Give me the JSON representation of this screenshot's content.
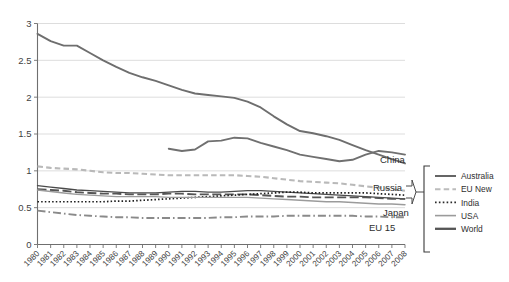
{
  "chart_data": {
    "type": "line",
    "title": "",
    "xlabel": "",
    "ylabel": "",
    "ylim": [
      0,
      3
    ],
    "yticks": [
      "0",
      "0.5",
      "1",
      "1.5",
      "2",
      "2.5",
      "3"
    ],
    "grid": true,
    "legend_position": "right",
    "x": [
      1980,
      1981,
      1982,
      1983,
      1984,
      1985,
      1986,
      1987,
      1988,
      1989,
      1990,
      1991,
      1992,
      1993,
      1994,
      1995,
      1996,
      1997,
      1998,
      1999,
      2000,
      2001,
      2002,
      2003,
      2004,
      2005,
      2006,
      2007,
      2008
    ],
    "xticklabels": [
      "1980",
      "1981",
      "1982",
      "1983",
      "1984",
      "1985",
      "1986",
      "1987",
      "1988",
      "1989",
      "1990",
      "1991",
      "1992",
      "1993",
      "1994",
      "1995",
      "1996",
      "1997",
      "1998",
      "1999",
      "2000",
      "2001",
      "2002",
      "2003",
      "2004",
      "2005",
      "2006",
      "2007",
      "2008"
    ],
    "series": [
      {
        "name": "China",
        "color": "#6e6e6e",
        "style": "solid",
        "width": 1.9,
        "values": [
          2.86,
          2.76,
          2.7,
          2.7,
          2.6,
          2.5,
          2.41,
          2.33,
          2.27,
          2.22,
          2.16,
          2.1,
          2.05,
          2.03,
          2.01,
          1.99,
          1.94,
          1.86,
          1.74,
          1.63,
          1.54,
          1.51,
          1.47,
          1.42,
          1.35,
          1.28,
          1.22,
          1.16,
          1.1
        ]
      },
      {
        "name": "Russia",
        "color": "#707070",
        "style": "solid",
        "width": 1.9,
        "values": [
          null,
          null,
          null,
          null,
          null,
          null,
          null,
          null,
          null,
          null,
          1.3,
          1.27,
          1.29,
          1.4,
          1.41,
          1.45,
          1.44,
          1.38,
          1.33,
          1.28,
          1.22,
          1.19,
          1.16,
          1.13,
          1.15,
          1.22,
          1.27,
          1.25,
          1.22
        ]
      },
      {
        "name": "Australia",
        "color": "#4a4a4a",
        "style": "solid",
        "width": 1.3,
        "values": [
          0.8,
          0.78,
          0.76,
          0.74,
          0.73,
          0.72,
          0.71,
          0.7,
          0.7,
          0.7,
          0.71,
          0.72,
          0.72,
          0.71,
          0.71,
          0.72,
          0.73,
          0.73,
          0.72,
          0.71,
          0.7,
          0.69,
          0.68,
          0.67,
          0.66,
          0.65,
          0.64,
          0.63,
          0.62
        ]
      },
      {
        "name": "World",
        "color": "#555555",
        "style": "dash-long",
        "width": 1.9,
        "values": [
          0.75,
          0.74,
          0.73,
          0.71,
          0.7,
          0.69,
          0.69,
          0.68,
          0.68,
          0.68,
          0.69,
          0.69,
          0.68,
          0.68,
          0.68,
          0.68,
          0.68,
          0.67,
          0.66,
          0.65,
          0.65,
          0.64,
          0.64,
          0.64,
          0.64,
          0.64,
          0.63,
          0.62,
          0.62
        ]
      },
      {
        "name": "India",
        "color": "#1e1e1e",
        "style": "dotted",
        "width": 1.7,
        "values": [
          0.58,
          0.58,
          0.58,
          0.58,
          0.58,
          0.58,
          0.59,
          0.59,
          0.6,
          0.61,
          0.62,
          0.63,
          0.64,
          0.65,
          0.66,
          0.67,
          0.68,
          0.69,
          0.7,
          0.71,
          0.71,
          0.7,
          0.7,
          0.7,
          0.7,
          0.7,
          0.69,
          0.68,
          0.67
        ]
      },
      {
        "name": "EU New",
        "color": "#b9b9b9",
        "style": "dash-med",
        "width": 2.1,
        "values": [
          1.06,
          1.04,
          1.03,
          1.02,
          1.0,
          0.98,
          0.97,
          0.97,
          0.96,
          0.95,
          0.94,
          0.94,
          0.94,
          0.94,
          0.94,
          0.94,
          0.93,
          0.92,
          0.9,
          0.88,
          0.86,
          0.85,
          0.84,
          0.83,
          0.81,
          0.79,
          0.77,
          0.75,
          0.73
        ]
      },
      {
        "name": "USA",
        "color": "#9b9b9b",
        "style": "solid",
        "width": 1.4,
        "values": [
          0.74,
          0.72,
          0.7,
          0.68,
          0.67,
          0.66,
          0.65,
          0.65,
          0.65,
          0.65,
          0.64,
          0.64,
          0.64,
          0.64,
          0.64,
          0.64,
          0.64,
          0.63,
          0.62,
          0.61,
          0.6,
          0.59,
          0.58,
          0.58,
          0.57,
          0.56,
          0.55,
          0.55,
          0.54
        ]
      },
      {
        "name": "Japan",
        "color": "#8a8a8a",
        "style": "dash-dot",
        "width": 1.8,
        "values": [
          0.46,
          0.44,
          0.42,
          0.4,
          0.39,
          0.38,
          0.37,
          0.37,
          0.36,
          0.36,
          0.36,
          0.36,
          0.36,
          0.36,
          0.37,
          0.37,
          0.38,
          0.38,
          0.38,
          0.39,
          0.39,
          0.39,
          0.39,
          0.39,
          0.39,
          0.38,
          0.38,
          0.37,
          0.37
        ]
      }
    ],
    "annotations": [
      {
        "label": "China",
        "x": 380,
        "y": 163
      },
      {
        "label": "Russia",
        "x": 373,
        "y": 191
      },
      {
        "label": "Japan",
        "x": 383,
        "y": 216
      },
      {
        "label": "EU 15",
        "x": 369,
        "y": 231
      }
    ]
  },
  "legend": {
    "items": [
      {
        "label": "Australia",
        "color": "#4a4a4a",
        "style": "solid",
        "width": 1.7
      },
      {
        "label": "EU New",
        "color": "#bcbcbc",
        "style": "dash-med",
        "width": 2.1
      },
      {
        "label": "India",
        "color": "#2a2a2a",
        "style": "dotted",
        "width": 1.8
      },
      {
        "label": "USA",
        "color": "#9b9b9b",
        "style": "solid",
        "width": 1.6
      },
      {
        "label": "World",
        "color": "#555555",
        "style": "solid",
        "width": 2.3
      }
    ]
  },
  "axis": {
    "y_ticks": [
      "0",
      "0.5",
      "1",
      "1.5",
      "2",
      "2.5",
      "3"
    ],
    "x_ticks": [
      "1980",
      "1981",
      "1982",
      "1983",
      "1984",
      "1985",
      "1986",
      "1987",
      "1988",
      "1989",
      "1990",
      "1991",
      "1992",
      "1993",
      "1994",
      "1995",
      "1996",
      "1997",
      "1998",
      "1999",
      "2000",
      "2001",
      "2002",
      "2003",
      "2004",
      "2005",
      "2006",
      "2007",
      "2008"
    ]
  },
  "colors": {
    "grid": "#d9d9d9",
    "axis": "#6f6f6f",
    "text": "#3b3b3b",
    "background": "#ffffff"
  }
}
